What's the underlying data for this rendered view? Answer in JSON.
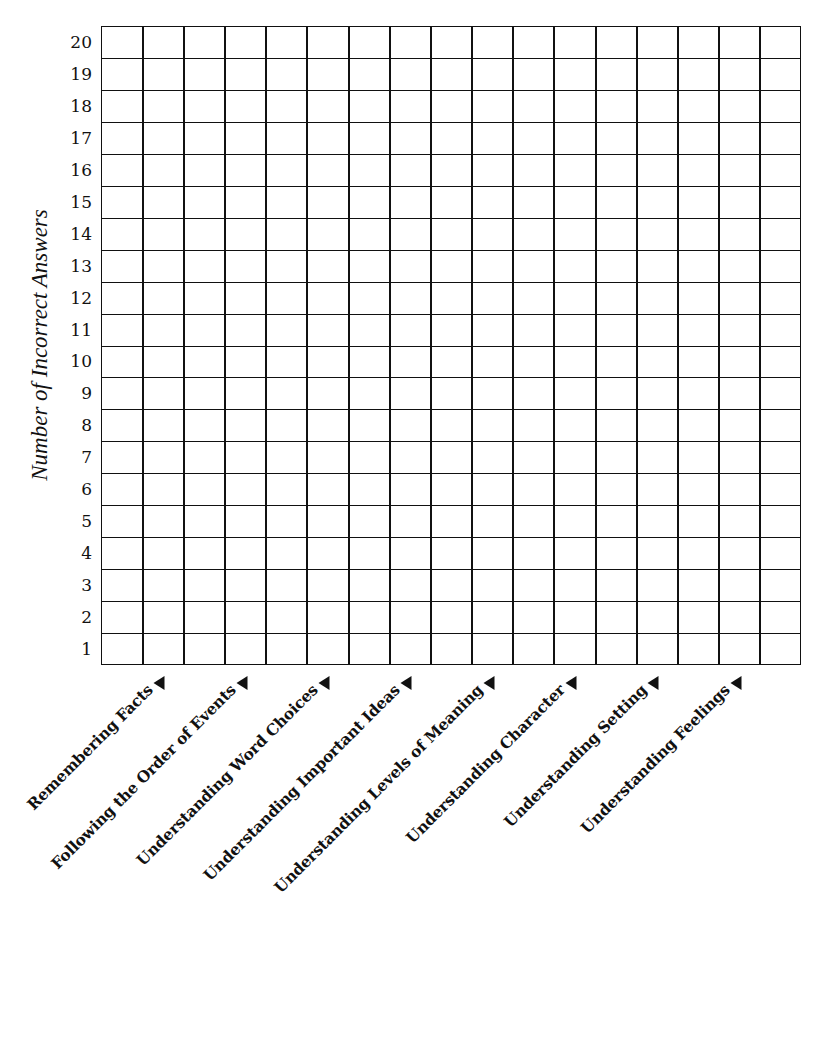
{
  "chart_data": {
    "type": "bar",
    "title": "",
    "xlabel": "",
    "ylabel": "Number of Incorrect Answers",
    "ylim": [
      0,
      20
    ],
    "yticks": [
      1,
      2,
      3,
      4,
      5,
      6,
      7,
      8,
      9,
      10,
      11,
      12,
      13,
      14,
      15,
      16,
      17,
      18,
      19,
      20
    ],
    "grid": true,
    "grid_columns": 17,
    "grid_rows": 20,
    "categories": [
      "Remembering Facts",
      "Following the Order of Events",
      "Understanding Word Choices",
      "Understanding Important Ideas",
      "Understanding Levels of Meaning",
      "Understanding Character",
      "Understanding Setting",
      "Understanding Feelings"
    ],
    "values": [
      null,
      null,
      null,
      null,
      null,
      null,
      null,
      null
    ],
    "legend": null
  },
  "axis": {
    "y_title": "Number of Incorrect Answers",
    "y_ticks": [
      "20",
      "19",
      "18",
      "17",
      "16",
      "15",
      "14",
      "13",
      "12",
      "11",
      "10",
      "9",
      "8",
      "7",
      "6",
      "5",
      "4",
      "3",
      "2",
      "1"
    ]
  },
  "labels": [
    "Remembering Facts",
    "Following the Order of Events",
    "Understanding Word Choices",
    "Understanding Important Ideas",
    "Understanding Levels of Meaning",
    "Understanding Character",
    "Understanding Setting",
    "Understanding Feelings"
  ],
  "icons": {
    "label_pointer": "left-triangle-arrow"
  },
  "colors": {
    "ink": "#111111",
    "paper": "#ffffff"
  }
}
